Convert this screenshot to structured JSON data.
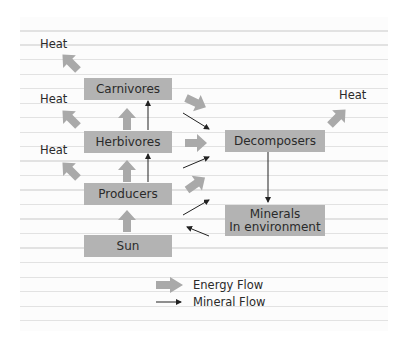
{
  "diagram": {
    "title": "",
    "nodes": {
      "carnivores": "Carnivores",
      "herbivores": "Herbivores",
      "producers": "Producers",
      "sun": "Sun",
      "decomposers": "Decomposers",
      "minerals_line1": "Minerals",
      "minerals_line2": "In environment"
    },
    "heat_labels": [
      "Heat",
      "Heat",
      "Heat",
      "Heat"
    ],
    "legend": {
      "energy_flow": "Energy Flow",
      "mineral_flow": "Mineral Flow"
    },
    "colors": {
      "box": "#b3b3b3",
      "energy_arrow": "#a9a9a9",
      "mineral_arrow": "#222222",
      "text": "#2a2a2a",
      "ruled_line": "#e2e2e2"
    }
  }
}
